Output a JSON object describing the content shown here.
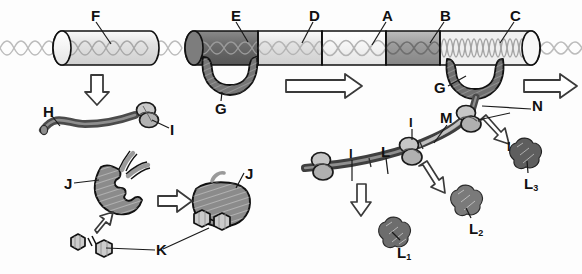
{
  "figure": {
    "title_cut_off": "",
    "background_color": "#fdfdfd",
    "ink_color": "#111111"
  },
  "palette": {
    "dna_strand": "#b9b9b9",
    "cylinder_outline": "#111111",
    "segment_very_light": "#f3f3f3",
    "segment_light": "#d9d9d9",
    "segment_mid": "#a8a8a8",
    "segment_dark": "#6e6e6e",
    "segment_darkest": "#595959",
    "polymerase": "#707070",
    "mrna_dark": "#4f4f4f",
    "mrna_light": "#b0b0b0",
    "ribosome": "#bdbdbd",
    "protein_blob": "#8a8a8a",
    "enzyme": "#8f8f8f",
    "substrate": "#cfcfcf",
    "arrow_fill": "#ffffff",
    "arrow_stroke": "#333333"
  },
  "labels": {
    "F": "F",
    "E": "E",
    "D": "D",
    "A": "A",
    "B": "B",
    "C": "C",
    "G_left": "G",
    "G_right": "G",
    "H": "H",
    "I_upper": "I",
    "I_left": "I",
    "I_mid": "I",
    "I_upper_right": "I",
    "J_left": "J",
    "J_right": "J",
    "K": "K",
    "L": "L",
    "M": "M",
    "N": "N",
    "L1_base": "L",
    "L1_sub": "1",
    "L2_base": "L",
    "L2_sub": "2",
    "L3_base": "L",
    "L3_sub": "3"
  },
  "elements": {
    "top_chromosome": {
      "name": "chromatin-fiber-upper-left",
      "segments": [
        {
          "id": "F",
          "shade": "#e6e6e6"
        }
      ]
    },
    "main_chromosome": {
      "name": "chromatin-fiber-main",
      "segments": [
        {
          "id": "E",
          "shade": "#6e6e6e",
          "coil": "sparse"
        },
        {
          "id": "D",
          "shade": "#dcdcdc",
          "coil": "sparse"
        },
        {
          "id": "A",
          "shade": "#f2f2f2",
          "coil": "sparse"
        },
        {
          "id": "B",
          "shade": "#9a9a9a",
          "coil": "sparse"
        },
        {
          "id": "C",
          "shade": "#ececec",
          "coil": "dense"
        }
      ]
    },
    "polymerases": [
      {
        "id": "G_left",
        "attached_to": "E"
      },
      {
        "id": "G_right",
        "attached_to": "C"
      }
    ],
    "products": [
      {
        "id": "H",
        "kind": "nascent-strand"
      },
      {
        "id": "I",
        "kind": "ribosome"
      },
      {
        "id": "J",
        "kind": "enzyme-protein"
      },
      {
        "id": "K",
        "kind": "substrate-hexagons"
      },
      {
        "id": "L",
        "kind": "mrna"
      },
      {
        "id": "M",
        "kind": "mrna-segment"
      },
      {
        "id": "N",
        "kind": "nascent-mrna"
      },
      {
        "id": "L1",
        "kind": "folded-protein"
      },
      {
        "id": "L2",
        "kind": "folded-protein"
      },
      {
        "id": "L3",
        "kind": "folded-protein"
      }
    ],
    "arrows": [
      {
        "name": "arrow-down-F",
        "direction": "down"
      },
      {
        "name": "arrow-right-middle",
        "direction": "right"
      },
      {
        "name": "arrow-right-far",
        "direction": "right"
      },
      {
        "name": "arrow-right-J",
        "direction": "right"
      },
      {
        "name": "arrow-up-K",
        "direction": "up"
      },
      {
        "name": "arrow-down-L1",
        "direction": "down"
      },
      {
        "name": "arrow-down-L2",
        "direction": "down-right"
      },
      {
        "name": "arrow-down-L3",
        "direction": "down-right"
      }
    ]
  }
}
